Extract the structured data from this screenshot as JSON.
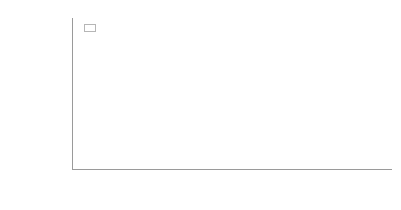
{
  "chart_data": {
    "type": "bar",
    "subtype": "stacked-bar-100-percent-annotated",
    "title": "",
    "xlabel": "",
    "ylabel": "MW",
    "ylim": [
      0,
      40000
    ],
    "ytick_step": 5000,
    "ytick_labels": [
      "40,000",
      "35,000",
      "30,000",
      "25,000",
      "20,000",
      "15,000",
      "10,000",
      "5,000"
    ],
    "ytick_values": [
      40000,
      35000,
      30000,
      25000,
      20000,
      15000,
      10000,
      5000
    ],
    "grid": true,
    "grid_axis": "y",
    "legend_position": "top-left-inside",
    "categories": [
      "2009E",
      "2010E",
      "2011E",
      "2012E",
      "2013E"
    ],
    "totals": [
      15700,
      20700,
      23600,
      29200,
      36000
    ],
    "series": [
      {
        "name": "Thin-Film",
        "role": "bottom-segment",
        "color": "#757575",
        "share_labels": [
          "18%",
          "22%",
          "24%",
          "24%",
          "25%"
        ],
        "share_values": [
          18,
          22,
          24,
          24,
          25
        ],
        "values": [
          2826,
          4554,
          5664,
          7008,
          9000
        ]
      },
      {
        "name": "cSi modules",
        "role": "top-segment",
        "color": "#828282",
        "share_labels": [
          "82%",
          "78%",
          "76%",
          "76%",
          "75%"
        ],
        "share_values": [
          82,
          78,
          76,
          76,
          75
        ],
        "values": [
          12874,
          16146,
          17936,
          22192,
          27000
        ]
      }
    ]
  },
  "legend": {
    "items": [
      {
        "label": "Thin-Film",
        "color": "#828282"
      },
      {
        "label": "cSi modules",
        "color": "#757575"
      }
    ]
  },
  "axes": {
    "y_title": "MW"
  }
}
